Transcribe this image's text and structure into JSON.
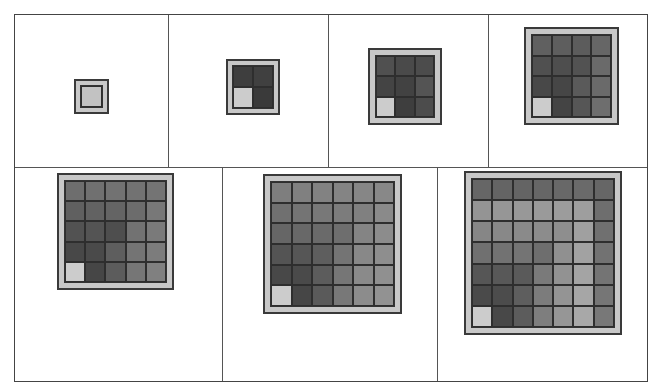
{
  "diagram": {
    "colors": {
      "frame": "#444444",
      "outer_border": "#c8c8c8",
      "corner_cell": "#cfcfcf",
      "single_cell": "#c2c2c2"
    },
    "panels": [
      {
        "n": 1,
        "box": [
          74,
          79,
          35,
          35
        ],
        "shades": [
          [
            "#c2c2c2"
          ]
        ]
      },
      {
        "n": 2,
        "box": [
          226,
          59,
          54,
          56
        ],
        "shades": [
          [
            "#3e3e3e",
            "#404040"
          ],
          [
            "#cccccc",
            "#3a3a3a"
          ]
        ]
      },
      {
        "n": 3,
        "box": [
          368,
          48,
          74,
          77
        ],
        "shades": [
          [
            "#505050",
            "#4a4a4a",
            "#4c4c4c"
          ],
          [
            "#444444",
            "#424242",
            "#545454"
          ],
          [
            "#cccccc",
            "#3e3e3e",
            "#4c4c4c"
          ]
        ]
      },
      {
        "n": 4,
        "box": [
          524,
          27,
          95,
          98
        ],
        "shades": [
          [
            "#606060",
            "#5e5e5e",
            "#5c5c5c",
            "#666666"
          ],
          [
            "#505050",
            "#4e4e4e",
            "#525252",
            "#6a6a6a"
          ],
          [
            "#484848",
            "#464646",
            "#5a5a5a",
            "#6a6a6a"
          ],
          [
            "#cccccc",
            "#444444",
            "#565656",
            "#6e6e6e"
          ]
        ]
      },
      {
        "n": 5,
        "box": [
          57,
          173,
          117,
          117
        ],
        "shades": [
          [
            "#6e6e6e",
            "#707070",
            "#727272",
            "#727272",
            "#747474"
          ],
          [
            "#606060",
            "#626262",
            "#646464",
            "#6c6c6c",
            "#787878"
          ],
          [
            "#525252",
            "#545454",
            "#4e4e4e",
            "#727272",
            "#7a7a7a"
          ],
          [
            "#484848",
            "#4a4a4a",
            "#5e5e5e",
            "#747474",
            "#7c7c7c"
          ],
          [
            "#cccccc",
            "#464646",
            "#5c5c5c",
            "#767676",
            "#808080"
          ]
        ]
      },
      {
        "n": 6,
        "box": [
          263,
          174,
          139,
          140
        ],
        "shades": [
          [
            "#7e7e7e",
            "#808080",
            "#828282",
            "#848484",
            "#868686",
            "#888888"
          ],
          [
            "#707070",
            "#747474",
            "#787878",
            "#7c7c7c",
            "#808080",
            "#8a8a8a"
          ],
          [
            "#666666",
            "#686868",
            "#6a6a6a",
            "#6e6e6e",
            "#848484",
            "#8c8c8c"
          ],
          [
            "#545454",
            "#565656",
            "#5e5e5e",
            "#747474",
            "#888888",
            "#8e8e8e"
          ],
          [
            "#484848",
            "#4a4a4a",
            "#5c5c5c",
            "#767676",
            "#8a8a8a",
            "#909090"
          ],
          [
            "#cccccc",
            "#464646",
            "#5a5a5a",
            "#787878",
            "#8c8c8c",
            "#929292"
          ]
        ]
      },
      {
        "n": 7,
        "box": [
          464,
          171,
          158,
          164
        ],
        "shades": [
          [
            "#666666",
            "#646464",
            "#646464",
            "#666666",
            "#686868",
            "#6a6a6a",
            "#666666"
          ],
          [
            "#949494",
            "#969696",
            "#989898",
            "#9a9a9a",
            "#9c9c9c",
            "#9e9e9e",
            "#6e6e6e"
          ],
          [
            "#868686",
            "#888888",
            "#8a8a8a",
            "#8c8c8c",
            "#8e8e8e",
            "#a0a0a0",
            "#707070"
          ],
          [
            "#707070",
            "#727272",
            "#747474",
            "#6e6e6e",
            "#909090",
            "#a2a2a2",
            "#727272"
          ],
          [
            "#565656",
            "#585858",
            "#5a5a5a",
            "#7a7a7a",
            "#929292",
            "#a4a4a4",
            "#747474"
          ],
          [
            "#4a4a4a",
            "#4c4c4c",
            "#5e5e5e",
            "#7c7c7c",
            "#949494",
            "#a6a6a6",
            "#767676"
          ],
          [
            "#cccccc",
            "#484848",
            "#5c5c5c",
            "#7e7e7e",
            "#969696",
            "#a8a8a8",
            "#787878"
          ]
        ]
      }
    ],
    "dividers": {
      "top_row_bottom_y": 167,
      "top_row_x": [
        168,
        328,
        488
      ],
      "bottom_row_x": [
        222,
        437
      ]
    }
  }
}
